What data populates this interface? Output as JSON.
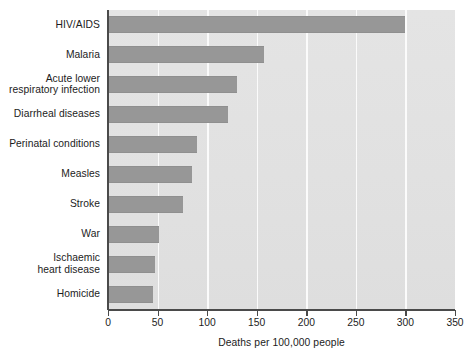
{
  "chart_data": {
    "type": "bar",
    "orientation": "horizontal",
    "title": "",
    "xlabel": "Deaths per 100,000 people",
    "ylabel": "",
    "xlim": [
      0,
      350
    ],
    "xticks": [
      0,
      50,
      100,
      150,
      200,
      250,
      300,
      350
    ],
    "xticklabels": [
      "0",
      "50",
      "100",
      "150",
      "200",
      "250",
      "300",
      "350"
    ],
    "grid": "vertical-only",
    "legend": "none",
    "categories": [
      "HIV/AIDS",
      "Malaria",
      "Acute lower\nrespiratory infection",
      "Diarrheal diseases",
      "Perinatal conditions",
      "Measles",
      "Stroke",
      "War",
      "Ischaemic\nheart disease",
      "Homicide"
    ],
    "values": [
      300,
      157,
      130,
      121,
      90,
      85,
      76,
      51,
      47,
      45
    ],
    "bar_color": "#979797",
    "plot_background": "#e2e2e2",
    "gridline_color": "#fbfbfb",
    "axis_color": "#4a4a4a"
  }
}
